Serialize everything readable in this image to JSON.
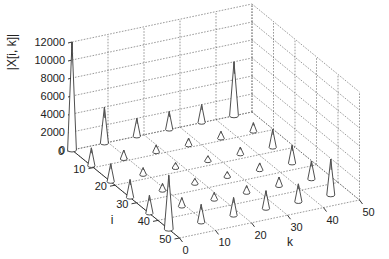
{
  "chart_data": {
    "type": "3d-stem",
    "title": "",
    "xlabel": "k",
    "ylabel": "i",
    "zlabel": "|X[i, k]|",
    "x_ticks": [
      0,
      10,
      20,
      30,
      40,
      50
    ],
    "y_ticks": [
      0,
      10,
      20,
      30,
      40,
      50
    ],
    "z_ticks": [
      0,
      2000,
      4000,
      6000,
      8000,
      10000,
      12000
    ],
    "xlim": [
      0,
      50
    ],
    "ylim": [
      0,
      50
    ],
    "zlim": [
      0,
      12000
    ],
    "grid": true,
    "points": [
      {
        "i": 0,
        "k": 0,
        "z": 12000
      },
      {
        "i": 0,
        "k": 9,
        "z": 4000
      },
      {
        "i": 0,
        "k": 18,
        "z": 2000
      },
      {
        "i": 0,
        "k": 27,
        "z": 2000
      },
      {
        "i": 0,
        "k": 36,
        "z": 2000
      },
      {
        "i": 0,
        "k": 45,
        "z": 6000
      },
      {
        "i": 9,
        "k": 0,
        "z": 2000
      },
      {
        "i": 9,
        "k": 9,
        "z": 1000
      },
      {
        "i": 9,
        "k": 18,
        "z": 800
      },
      {
        "i": 9,
        "k": 27,
        "z": 800
      },
      {
        "i": 9,
        "k": 36,
        "z": 800
      },
      {
        "i": 9,
        "k": 45,
        "z": 1000
      },
      {
        "i": 18,
        "k": 0,
        "z": 2000
      },
      {
        "i": 18,
        "k": 9,
        "z": 800
      },
      {
        "i": 18,
        "k": 18,
        "z": 600
      },
      {
        "i": 18,
        "k": 27,
        "z": 600
      },
      {
        "i": 18,
        "k": 36,
        "z": 800
      },
      {
        "i": 18,
        "k": 45,
        "z": 2000
      },
      {
        "i": 27,
        "k": 0,
        "z": 2000
      },
      {
        "i": 27,
        "k": 9,
        "z": 800
      },
      {
        "i": 27,
        "k": 18,
        "z": 600
      },
      {
        "i": 27,
        "k": 27,
        "z": 600
      },
      {
        "i": 27,
        "k": 36,
        "z": 800
      },
      {
        "i": 27,
        "k": 45,
        "z": 2000
      },
      {
        "i": 36,
        "k": 0,
        "z": 2000
      },
      {
        "i": 36,
        "k": 9,
        "z": 1000
      },
      {
        "i": 36,
        "k": 18,
        "z": 800
      },
      {
        "i": 36,
        "k": 27,
        "z": 800
      },
      {
        "i": 36,
        "k": 36,
        "z": 1000
      },
      {
        "i": 36,
        "k": 45,
        "z": 2000
      },
      {
        "i": 45,
        "k": 0,
        "z": 6000
      },
      {
        "i": 45,
        "k": 9,
        "z": 2000
      },
      {
        "i": 45,
        "k": 18,
        "z": 2000
      },
      {
        "i": 45,
        "k": 27,
        "z": 2000
      },
      {
        "i": 45,
        "k": 36,
        "z": 2000
      },
      {
        "i": 45,
        "k": 45,
        "z": 4000
      }
    ],
    "projection": {
      "origin": [
        72,
        150
      ],
      "i_per_unit": [
        2.15,
        1.76
      ],
      "k_per_unit": [
        3.6,
        -0.76
      ],
      "z_per_unit": 0.009
    }
  }
}
